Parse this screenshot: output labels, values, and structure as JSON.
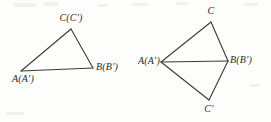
{
  "figure": {
    "type": "geometry-diagram",
    "width": 271,
    "height": 122,
    "background_color": "#fdfdfc",
    "stroke_color": "#3a3a3a",
    "text_color": "#2b2b2b",
    "stroke_width": 1.1
  },
  "left_figure": {
    "name": "triangle-abc-coincident",
    "vertices": [
      {
        "id": "A",
        "label": "A(A′)",
        "x": 21,
        "y": 71,
        "label_x": 21,
        "label_y": 74,
        "label_align": "centered"
      },
      {
        "id": "B",
        "label": "B(B′)",
        "x": 93,
        "y": 68,
        "label_x": 96,
        "label_y": 62,
        "label_align": "left"
      },
      {
        "id": "C",
        "label": "C(C′)",
        "x": 71,
        "y": 29,
        "label_x": 71,
        "label_y": 13,
        "label_align": "centered"
      }
    ],
    "edges": [
      {
        "name": "edge-ab",
        "from": "A",
        "to": "B"
      },
      {
        "name": "edge-bc",
        "from": "B",
        "to": "C"
      },
      {
        "name": "edge-ca",
        "from": "C",
        "to": "A"
      }
    ]
  },
  "right_figure": {
    "name": "kite-abc-c-prime",
    "vertices": [
      {
        "id": "A",
        "label": "A(A′)",
        "x": 161,
        "y": 62,
        "label_x": 158,
        "label_y": 56,
        "label_align": "right"
      },
      {
        "id": "B",
        "label": "B(B′)",
        "x": 228,
        "y": 61,
        "label_x": 231,
        "label_y": 55,
        "label_align": "left"
      },
      {
        "id": "C",
        "label": "C",
        "x": 211,
        "y": 22,
        "label_x": 211,
        "label_y": 6,
        "label_align": "centered"
      },
      {
        "id": "Cp",
        "label": "C′",
        "x": 209,
        "y": 100,
        "label_x": 209,
        "label_y": 104,
        "label_align": "centered"
      }
    ],
    "edges": [
      {
        "name": "edge-ac",
        "from": "A",
        "to": "C"
      },
      {
        "name": "edge-cb",
        "from": "C",
        "to": "B"
      },
      {
        "name": "edge-ab",
        "from": "A",
        "to": "B"
      },
      {
        "name": "edge-b-cprime",
        "from": "B",
        "to": "Cp"
      },
      {
        "name": "edge-cprime-a",
        "from": "Cp",
        "to": "A"
      }
    ]
  }
}
